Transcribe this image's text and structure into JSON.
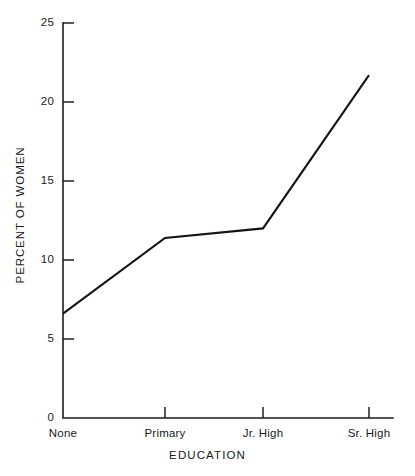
{
  "chart_data": {
    "type": "line",
    "title": "",
    "xlabel": "EDUCATION",
    "ylabel": "PERCENT OF WOMEN",
    "categories": [
      "None",
      "Primary",
      "Jr. High",
      "Sr. High"
    ],
    "values": [
      6.6,
      11.4,
      12.0,
      21.7
    ],
    "series": [
      {
        "name": "Percent of women",
        "values": [
          6.6,
          11.4,
          12.0,
          21.7
        ]
      }
    ],
    "ylim": [
      0,
      25
    ],
    "ytick_labels": [
      "0",
      "5",
      "10",
      "15",
      "20",
      "25"
    ],
    "ytick_values": [
      0,
      5,
      10,
      15,
      20,
      25
    ],
    "xtick_labels": [
      "None",
      "Primary",
      "Jr. High",
      "Sr. High"
    ],
    "grid": false,
    "legend": false,
    "legend_position": "none",
    "line_color": "#141414",
    "axis_color": "#1f1f1f",
    "background_color": "#ffffff",
    "tick_direction": "in",
    "frame": "left-bottom"
  },
  "figure": {
    "xaxis_title": "EDUCATION",
    "yaxis_title": "PERCENT OF WOMEN"
  }
}
